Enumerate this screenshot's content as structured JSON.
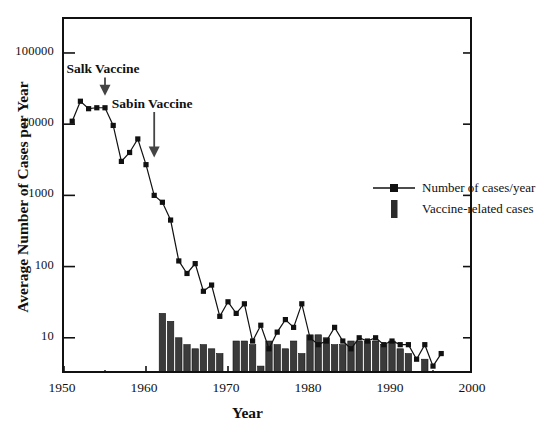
{
  "chart_data": {
    "type": "line",
    "title": "",
    "xlabel": "Year",
    "ylabel": "Average Number of Cases per Year",
    "yscale": "log",
    "ylim": [
      3,
      300000
    ],
    "xlim": [
      1950,
      2000
    ],
    "grid": false,
    "legend_position": "inside-right",
    "y_ticks": [
      10,
      100,
      1000,
      10000,
      100000
    ],
    "y_tick_labels": [
      "10",
      "100",
      "1000",
      "10000",
      "100000"
    ],
    "x_ticks": [
      1950,
      1960,
      1970,
      1980,
      1990,
      2000
    ],
    "x_tick_labels": [
      "1950",
      "1960",
      "1970",
      "1980",
      "1990",
      "2000"
    ],
    "x_minor_ticks": [
      1955,
      1965,
      1975,
      1985,
      1995
    ],
    "series": [
      {
        "name": "Number of cases/year",
        "type": "line",
        "marker": "square",
        "color": "#111111",
        "x": [
          1951,
          1952,
          1953,
          1954,
          1955,
          1956,
          1957,
          1958,
          1959,
          1960,
          1961,
          1962,
          1963,
          1964,
          1965,
          1966,
          1967,
          1968,
          1969,
          1970,
          1971,
          1972,
          1973,
          1974,
          1975,
          1976,
          1977,
          1978,
          1979,
          1980,
          1981,
          1982,
          1983,
          1984,
          1985,
          1986,
          1987,
          1988,
          1989,
          1990,
          1991,
          1992,
          1993,
          1994,
          1995,
          1996
        ],
        "y": [
          11000,
          21000,
          16500,
          17000,
          17000,
          9600,
          3000,
          4000,
          6200,
          2700,
          1000,
          800,
          450,
          120,
          80,
          110,
          45,
          55,
          20,
          32,
          22,
          30,
          9,
          15,
          7,
          12,
          18,
          14,
          30,
          10,
          8,
          9,
          14,
          9,
          7,
          10,
          9,
          10,
          8,
          9,
          8,
          8,
          5,
          8,
          4,
          6
        ]
      },
      {
        "name": "Vaccine-related cases",
        "type": "bar",
        "color": "#3b3b3b",
        "x": [
          1961,
          1962,
          1963,
          1964,
          1965,
          1966,
          1967,
          1968,
          1969,
          1970,
          1971,
          1972,
          1973,
          1974,
          1975,
          1976,
          1977,
          1978,
          1979,
          1980,
          1981,
          1982,
          1983,
          1984,
          1985,
          1986,
          1987,
          1988,
          1989,
          1990,
          1991,
          1992,
          1993,
          1994,
          1995
        ],
        "y": [
          3,
          22,
          17,
          10,
          8,
          7,
          8,
          7,
          6,
          0,
          9,
          9,
          8,
          4,
          9,
          8,
          7,
          9,
          6,
          11,
          11,
          10,
          8,
          8,
          9,
          9,
          9,
          9,
          8,
          9,
          7,
          6,
          3,
          5,
          0
        ]
      }
    ],
    "annotations": [
      {
        "text": "Salk Vaccine",
        "x": 1955,
        "label_y": 55000,
        "arrow_to_y": 22000
      },
      {
        "text": "Sabin Vaccine",
        "x": 1961,
        "label_y": 18000,
        "arrow_to_y": 3000
      }
    ]
  },
  "legend": {
    "items": [
      {
        "label": "Number of cases/year",
        "key": "line-marker-key"
      },
      {
        "label": "Vaccine-related cases",
        "key": "bar-swatch-key"
      }
    ]
  },
  "colors": {
    "axis": "#111111",
    "line": "#111111",
    "bar": "#3b3b3b",
    "background": "#ffffff"
  }
}
